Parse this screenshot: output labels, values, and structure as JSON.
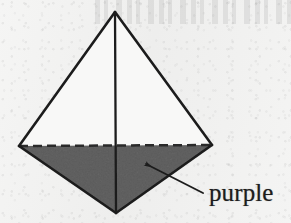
{
  "figure": {
    "kind": "solid-geometry-diagram",
    "shape_name": "tetrahedron",
    "alt": "Tetrahedron with shaded lower face",
    "colors": {
      "paper": "#f3f3f2",
      "ink": "#1d1d1d",
      "shaded_face_fill": "#9b9b9b",
      "unshaded_face_fill": "#f7f7f6"
    },
    "vertices": {
      "apex": {
        "x": 115,
        "y": 12
      },
      "left": {
        "x": 19,
        "y": 146
      },
      "right": {
        "x": 212,
        "y": 145
      },
      "bottom": {
        "x": 116,
        "y": 213
      }
    },
    "edges": [
      {
        "name": "apex-to-left",
        "style": "solid",
        "from": "apex",
        "to": "left"
      },
      {
        "name": "apex-to-right",
        "style": "solid",
        "from": "apex",
        "to": "right"
      },
      {
        "name": "apex-to-bottom",
        "style": "solid",
        "from": "apex",
        "to": "bottom"
      },
      {
        "name": "left-to-bottom",
        "style": "solid",
        "from": "left",
        "to": "bottom"
      },
      {
        "name": "right-to-bottom",
        "style": "solid",
        "from": "right",
        "to": "bottom"
      },
      {
        "name": "left-to-right-hidden",
        "style": "dashed",
        "from": "left",
        "to": "right"
      }
    ],
    "shaded_face": {
      "name": "lower-front-face",
      "vertices": [
        "left",
        "right",
        "bottom"
      ],
      "fill": "#9b9b9b"
    },
    "stroke_width": 2.4,
    "dash_pattern": "9 5"
  },
  "annotation": {
    "label": "purple",
    "arrow": {
      "name": "purple-callout-arrow",
      "tail": {
        "x": 203,
        "y": 193
      },
      "head": {
        "x": 143,
        "y": 162
      },
      "points_to": "shaded lower face"
    }
  }
}
